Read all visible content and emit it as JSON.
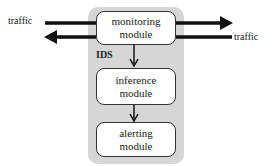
{
  "diagram": {
    "container_label": "IDS",
    "modules": [
      {
        "id": "monitoring",
        "line1": "monitoring",
        "line2": "module"
      },
      {
        "id": "inference",
        "line1": "inference",
        "line2": "module"
      },
      {
        "id": "alerting",
        "line1": "alerting",
        "line2": "module"
      }
    ],
    "traffic_left": "traffic",
    "traffic_right": "traffic",
    "edges": [
      {
        "from": "traffic (left)",
        "to": "monitoring module",
        "note": "incoming line"
      },
      {
        "from": "monitoring module",
        "to": "traffic (right)",
        "note": "arrow right"
      },
      {
        "from": "traffic (right)",
        "to": "monitoring module",
        "note": "incoming line"
      },
      {
        "from": "monitoring module",
        "to": "traffic (left)",
        "note": "arrow left"
      },
      {
        "from": "monitoring module",
        "to": "inference module"
      },
      {
        "from": "inference module",
        "to": "alerting module"
      }
    ],
    "colors": {
      "container": "#d6d6d6",
      "box": "#ffffff",
      "stroke": "#111111"
    }
  }
}
